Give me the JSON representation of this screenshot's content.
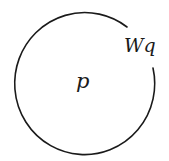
{
  "diagram": {
    "shape": "open-circle",
    "stroke_color": "#1a1a1a",
    "background": "#ffffff",
    "center_label": "p",
    "boundary_label": "Wq"
  }
}
